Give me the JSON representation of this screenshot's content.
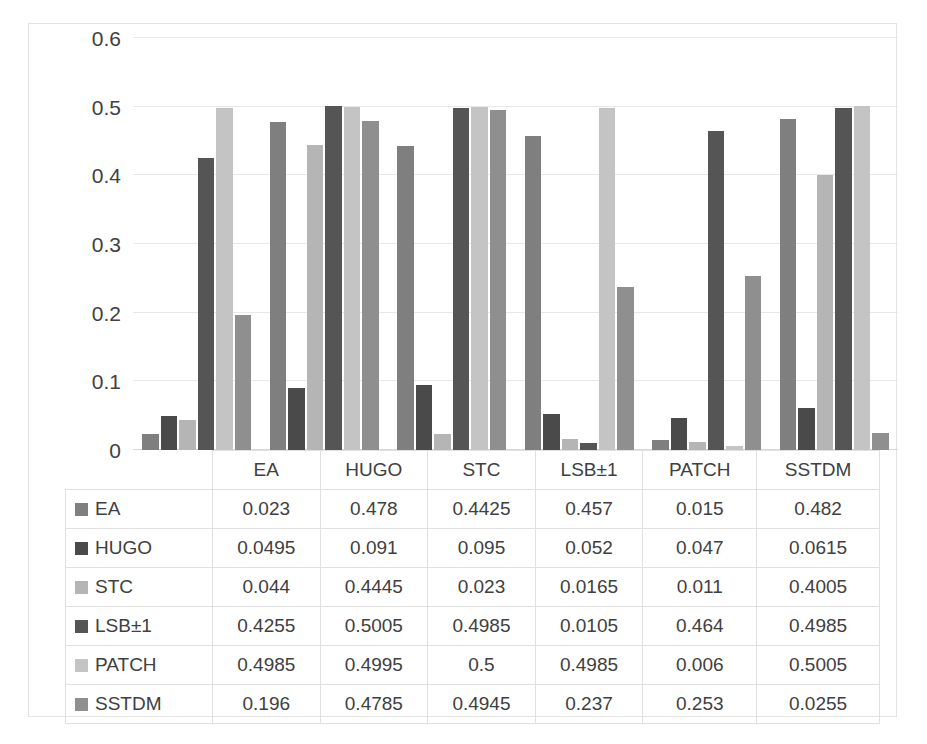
{
  "chart_data": {
    "type": "bar",
    "title": "",
    "subtitle": "",
    "xlabel": "",
    "ylabel": "",
    "ylim": [
      0,
      0.6
    ],
    "grid": true,
    "legend_position": "table-below",
    "categories": [
      "EA",
      "HUGO",
      "STC",
      "LSB±1",
      "PATCH",
      "SSTDM"
    ],
    "y_ticks": [
      "0",
      "0.1",
      "0.2",
      "0.3",
      "0.4",
      "0.5",
      "0.6"
    ],
    "y_tick_values": [
      0,
      0.1,
      0.2,
      0.3,
      0.4,
      0.5,
      0.6
    ],
    "series": [
      {
        "name": "EA",
        "color": "#7f7f7f",
        "values": [
          0.023,
          0.478,
          0.4425,
          0.457,
          0.015,
          0.482
        ]
      },
      {
        "name": "HUGO",
        "color": "#4a4a4a",
        "values": [
          0.0495,
          0.091,
          0.095,
          0.052,
          0.047,
          0.0615
        ]
      },
      {
        "name": "STC",
        "color": "#b5b5b5",
        "values": [
          0.044,
          0.4445,
          0.023,
          0.0165,
          0.011,
          0.4005
        ]
      },
      {
        "name": "LSB±1",
        "color": "#555555",
        "values": [
          0.4255,
          0.5005,
          0.4985,
          0.0105,
          0.464,
          0.4985
        ]
      },
      {
        "name": "PATCH",
        "color": "#c4c4c4",
        "values": [
          0.4985,
          0.4995,
          0.5,
          0.4985,
          0.006,
          0.5005
        ]
      },
      {
        "name": "SSTDM",
        "color": "#8f8f8f",
        "values": [
          0.196,
          0.4785,
          0.4945,
          0.237,
          0.253,
          0.0255
        ]
      }
    ]
  },
  "table": {
    "header": [
      "",
      "EA",
      "HUGO",
      "STC",
      "LSB±1",
      "PATCH",
      "SSTDM"
    ],
    "rows": [
      {
        "label": "EA",
        "color": "#7f7f7f",
        "cells": [
          "0.023",
          "0.478",
          "0.4425",
          "0.457",
          "0.015",
          "0.482"
        ]
      },
      {
        "label": "HUGO",
        "color": "#4a4a4a",
        "cells": [
          "0.0495",
          "0.091",
          "0.095",
          "0.052",
          "0.047",
          "0.0615"
        ]
      },
      {
        "label": "STC",
        "color": "#b5b5b5",
        "cells": [
          "0.044",
          "0.4445",
          "0.023",
          "0.0165",
          "0.011",
          "0.4005"
        ]
      },
      {
        "label": "LSB±1",
        "color": "#555555",
        "cells": [
          "0.4255",
          "0.5005",
          "0.4985",
          "0.0105",
          "0.464",
          "0.4985"
        ]
      },
      {
        "label": "PATCH",
        "color": "#c4c4c4",
        "cells": [
          "0.4985",
          "0.4995",
          "0.5",
          "0.4985",
          "0.006",
          "0.5005"
        ]
      },
      {
        "label": "SSTDM",
        "color": "#8f8f8f",
        "cells": [
          "0.196",
          "0.4785",
          "0.4945",
          "0.237",
          "0.253",
          "0.0255"
        ]
      }
    ]
  },
  "colors": {
    "gridline": "#e8e8e8",
    "border": "#e3e3e3",
    "text": "#404040",
    "background": "#ffffff"
  }
}
